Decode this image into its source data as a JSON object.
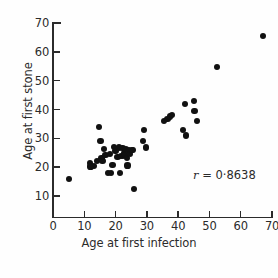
{
  "chart_data": {
    "type": "scatter",
    "title": "",
    "xlabel": "Age at first infection",
    "ylabel": "Age at first stone",
    "xlim": [
      0,
      70
    ],
    "ylim": [
      5,
      70
    ],
    "grid": false,
    "legend": null,
    "xticks": [
      0,
      10,
      20,
      30,
      40,
      50,
      60,
      70
    ],
    "xticklabels": [
      "0",
      "10",
      "20",
      "30",
      "40",
      "50",
      "60",
      "70"
    ],
    "yticks": [
      10,
      20,
      30,
      40,
      50,
      60,
      70
    ],
    "yticklabels": [
      "10",
      "20",
      "30",
      "40",
      "50",
      "60",
      "70"
    ],
    "annotations": [
      {
        "name": "correlation-coefficient",
        "symbol": "r",
        "equals": " = ",
        "value": "0·8638",
        "numeric_value": 0.8638,
        "text": "r = 0·8638"
      }
    ],
    "marker": {
      "shape": "circle",
      "filled": true,
      "color": "#111111",
      "size_px": 6.2
    },
    "n_points": 45,
    "points": [
      {
        "x": 5.0,
        "y": 16.0
      },
      {
        "x": 11.8,
        "y": 21.5
      },
      {
        "x": 12.0,
        "y": 20.2
      },
      {
        "x": 13.2,
        "y": 20.3
      },
      {
        "x": 14.0,
        "y": 22.0
      },
      {
        "x": 14.8,
        "y": 34.0
      },
      {
        "x": 15.2,
        "y": 29.0
      },
      {
        "x": 15.5,
        "y": 23.0
      },
      {
        "x": 15.8,
        "y": 22.2
      },
      {
        "x": 16.2,
        "y": 26.2
      },
      {
        "x": 16.8,
        "y": 24.3
      },
      {
        "x": 17.5,
        "y": 18.0
      },
      {
        "x": 18.2,
        "y": 24.6
      },
      {
        "x": 18.6,
        "y": 18.0
      },
      {
        "x": 19.0,
        "y": 20.8
      },
      {
        "x": 19.4,
        "y": 27.0
      },
      {
        "x": 20.0,
        "y": 25.5
      },
      {
        "x": 20.6,
        "y": 23.4
      },
      {
        "x": 21.0,
        "y": 26.8
      },
      {
        "x": 21.4,
        "y": 18.0
      },
      {
        "x": 21.8,
        "y": 24.0
      },
      {
        "x": 22.2,
        "y": 26.6
      },
      {
        "x": 22.4,
        "y": 23.8
      },
      {
        "x": 22.8,
        "y": 25.0
      },
      {
        "x": 23.0,
        "y": 24.2
      },
      {
        "x": 23.4,
        "y": 26.4
      },
      {
        "x": 23.6,
        "y": 23.2
      },
      {
        "x": 23.8,
        "y": 20.6
      },
      {
        "x": 24.2,
        "y": 25.8
      },
      {
        "x": 24.6,
        "y": 24.6
      },
      {
        "x": 25.2,
        "y": 26.0
      },
      {
        "x": 25.6,
        "y": 26.0
      },
      {
        "x": 26.0,
        "y": 12.5
      },
      {
        "x": 28.8,
        "y": 29.0
      },
      {
        "x": 29.2,
        "y": 33.0
      },
      {
        "x": 29.6,
        "y": 26.8
      },
      {
        "x": 35.6,
        "y": 36.0
      },
      {
        "x": 36.6,
        "y": 36.6
      },
      {
        "x": 37.4,
        "y": 37.6
      },
      {
        "x": 38.0,
        "y": 38.0
      },
      {
        "x": 41.6,
        "y": 33.0
      },
      {
        "x": 42.2,
        "y": 42.0
      },
      {
        "x": 42.4,
        "y": 31.0
      },
      {
        "x": 45.0,
        "y": 43.0
      },
      {
        "x": 45.2,
        "y": 39.4
      },
      {
        "x": 46.0,
        "y": 36.0
      },
      {
        "x": 52.4,
        "y": 54.8
      },
      {
        "x": 67.0,
        "y": 65.6
      }
    ]
  }
}
